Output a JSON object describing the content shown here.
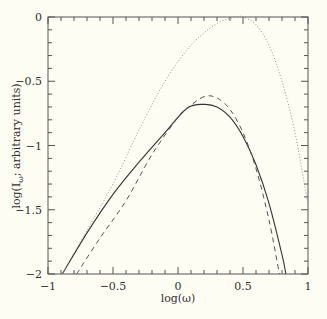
{
  "chart_data": {
    "type": "line",
    "title": "",
    "xlabel": "log(ω)",
    "ylabel": "log(I_ω; arbitrary units)",
    "xlim": [
      -1,
      1
    ],
    "ylim": [
      -2,
      0
    ],
    "x_ticks": [
      -1,
      -0.5,
      0,
      0.5,
      1
    ],
    "x_tick_labels": [
      "−1",
      "−0.5",
      "0",
      "0.5",
      "1"
    ],
    "y_ticks": [
      0,
      -0.5,
      -1,
      -1.5,
      -2
    ],
    "y_tick_labels": [
      "0",
      "−0.5",
      "−1",
      "−1.5",
      "−2"
    ],
    "minor_tick_step": 0.1,
    "grid": false,
    "legend": null,
    "series": [
      {
        "name": "solid",
        "style": "solid",
        "x": [
          -0.89,
          -0.7,
          -0.5,
          -0.3,
          -0.1,
          0.07,
          0.2,
          0.3,
          0.4,
          0.5,
          0.6,
          0.7,
          0.8,
          0.83
        ],
        "y": [
          -2.0,
          -1.68,
          -1.38,
          -1.13,
          -0.9,
          -0.71,
          -0.68,
          -0.7,
          -0.78,
          -0.93,
          -1.15,
          -1.45,
          -1.85,
          -2.0
        ]
      },
      {
        "name": "dashed",
        "style": "dashed",
        "x": [
          -0.78,
          -0.6,
          -0.4,
          -0.2,
          0.0,
          0.07,
          0.2,
          0.3,
          0.4,
          0.5,
          0.6,
          0.7,
          0.78
        ],
        "y": [
          -2.0,
          -1.72,
          -1.43,
          -1.07,
          -0.78,
          -0.71,
          -0.62,
          -0.63,
          -0.72,
          -0.9,
          -1.18,
          -1.58,
          -2.0
        ]
      },
      {
        "name": "dotted",
        "style": "dotted",
        "x": [
          -0.89,
          -0.7,
          -0.5,
          -0.3,
          -0.1,
          0.1,
          0.3,
          0.45,
          0.5,
          0.6,
          0.7,
          0.8,
          0.9,
          1.0
        ],
        "y": [
          -2.0,
          -1.66,
          -1.3,
          -0.88,
          -0.5,
          -0.22,
          -0.05,
          0.0,
          0.0,
          -0.06,
          -0.22,
          -0.5,
          -0.9,
          -1.46
        ]
      }
    ]
  },
  "colors": {
    "background": "#fdfdf4",
    "axis": "#555555",
    "solid": "#333333",
    "dashed": "#555555",
    "dotted": "#888888"
  }
}
